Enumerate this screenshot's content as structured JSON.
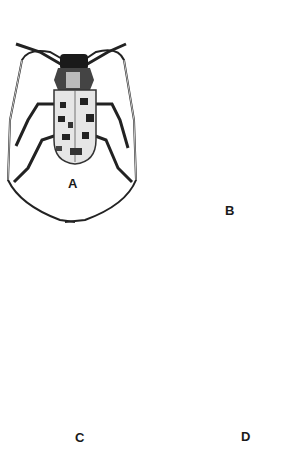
{
  "figure": {
    "panels": [
      {
        "id": "A",
        "label": "A",
        "subject": "longhorn beetle with spotted elytra and long antennae"
      },
      {
        "id": "B",
        "label": "B",
        "subject": "oval beetle with striated mottled elytra and dark banding"
      },
      {
        "id": "C",
        "label": "C",
        "subject": "round beetle with bold black longitudinal stripes"
      },
      {
        "id": "D",
        "label": "D",
        "subject": "dark glossy beetle with punctured elytra"
      }
    ],
    "colors": {
      "ink": "#1a1a1a",
      "paper": "#ffffff",
      "mid": "#8a8a8a",
      "light": "#d9d9d9"
    }
  }
}
